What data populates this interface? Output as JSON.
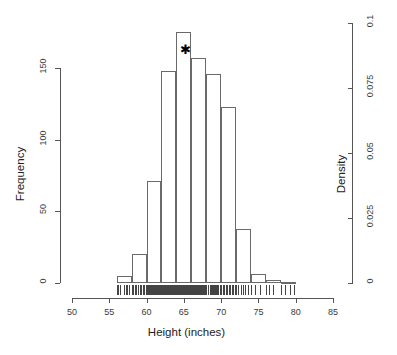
{
  "chart_data": {
    "type": "bar",
    "title": "",
    "subtitle": "",
    "xlabel": "Height (inches)",
    "ylabel": "Frequency",
    "y2label": "Density",
    "grid": false,
    "legend": "none",
    "xlim": [
      50,
      85
    ],
    "ylim": [
      0,
      180
    ],
    "y2lim": [
      0,
      0.103
    ],
    "xticks": [
      50,
      55,
      60,
      65,
      70,
      75,
      80,
      85
    ],
    "xtick_labels": [
      "50",
      "55",
      "60",
      "65",
      "70",
      "75",
      "80",
      "85"
    ],
    "yticks": [
      0,
      50,
      100,
      150
    ],
    "ytick_labels": [
      "0",
      "50",
      "100",
      "150"
    ],
    "y2ticks": [
      0,
      0.025,
      0.05,
      0.075,
      0.1
    ],
    "y2tick_labels": [
      "0",
      "0.025",
      "0.05",
      "0.075",
      "0.1"
    ],
    "bin_width": 2,
    "bin_edges": [
      56,
      58,
      60,
      62,
      64,
      66,
      68,
      70,
      72,
      74,
      76,
      78,
      80
    ],
    "categories": [
      "56-58",
      "58-60",
      "60-62",
      "62-64",
      "64-66",
      "66-68",
      "68-70",
      "70-72",
      "72-74",
      "74-76",
      "76-78",
      "78-80"
    ],
    "values": [
      5,
      20,
      71,
      148,
      175,
      157,
      146,
      123,
      38,
      6,
      2,
      1
    ],
    "density_values": [
      0.0029,
      0.0114,
      0.0406,
      0.0846,
      0.1,
      0.0897,
      0.0834,
      0.0703,
      0.0217,
      0.0034,
      0.0011,
      0.0006
    ],
    "annotations": [
      {
        "name": "star-marker",
        "symbol": "✱",
        "x": 65,
        "y": 163,
        "note": "marks modal bin 64-66"
      }
    ],
    "rug": {
      "present": true,
      "label": "rug-ticks",
      "range": [
        56,
        80
      ],
      "values": [
        56.1,
        56.2,
        56.5,
        57.0,
        57.2,
        57.4,
        57.6,
        58.0,
        58.2,
        58.4,
        58.6,
        58.9,
        59.1,
        59.3,
        59.5,
        59.7,
        59.9,
        60.0,
        60.1,
        60.2,
        60.3,
        60.4,
        60.5,
        60.6,
        60.7,
        60.8,
        60.9,
        61.0,
        61.1,
        61.2,
        61.3,
        61.4,
        61.5,
        61.6,
        61.7,
        61.8,
        61.9,
        62.0,
        62.1,
        62.2,
        62.3,
        62.4,
        62.5,
        62.6,
        62.7,
        62.8,
        62.9,
        63.0,
        63.1,
        63.2,
        63.3,
        63.4,
        63.5,
        63.6,
        63.7,
        63.8,
        63.9,
        64.0,
        64.1,
        64.2,
        64.3,
        64.4,
        64.5,
        64.6,
        64.7,
        64.8,
        64.9,
        65.0,
        65.1,
        65.2,
        65.3,
        65.4,
        65.5,
        65.6,
        65.7,
        65.8,
        65.9,
        66.0,
        66.1,
        66.2,
        66.3,
        66.4,
        66.5,
        66.6,
        66.7,
        66.8,
        66.9,
        67.0,
        67.1,
        67.2,
        67.3,
        67.4,
        67.5,
        67.6,
        67.7,
        67.8,
        67.9,
        68.0,
        68.2,
        68.3,
        68.5,
        68.6,
        68.8,
        68.9,
        69.0,
        69.2,
        69.3,
        69.5,
        69.6,
        69.8,
        69.9,
        70.0,
        70.2,
        70.4,
        70.6,
        70.8,
        71.0,
        71.2,
        71.4,
        71.6,
        71.8,
        72.0,
        72.3,
        72.6,
        72.9,
        73.2,
        73.6,
        74.0,
        74.6,
        75.2,
        76.0,
        76.4,
        77.0,
        78.0,
        78.6,
        79.2,
        79.8
      ]
    }
  }
}
